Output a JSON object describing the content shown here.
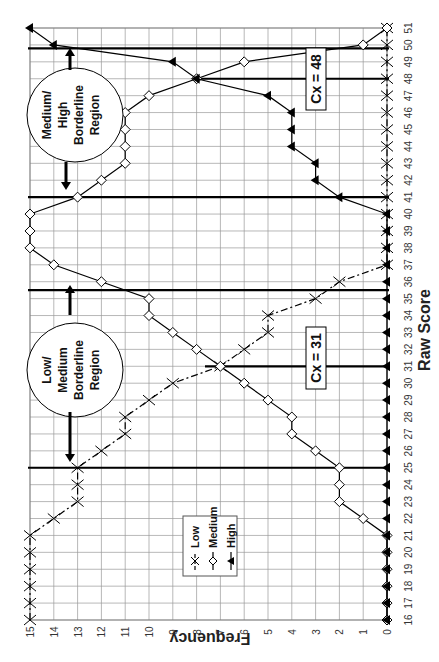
{
  "chart_data": {
    "type": "line",
    "orientation": "rotated-90-clockwise",
    "title": "",
    "xlabel": "Raw Score",
    "ylabel": "Frequency",
    "x": [
      16,
      17,
      18,
      19,
      20,
      21,
      22,
      23,
      24,
      25,
      26,
      27,
      28,
      29,
      30,
      31,
      32,
      33,
      34,
      35,
      36,
      37,
      38,
      39,
      40,
      41,
      42,
      43,
      44,
      45,
      46,
      47,
      48,
      49,
      50,
      51
    ],
    "xlim": [
      16,
      51
    ],
    "ylim": [
      0,
      15
    ],
    "x_ticks": [
      "16",
      "17",
      "18",
      "19",
      "20",
      "21",
      "22",
      "23",
      "24",
      "25",
      "26",
      "27",
      "28",
      "29",
      "30",
      "31",
      "32",
      "33",
      "34",
      "35",
      "36",
      "37",
      "38",
      "39",
      "40",
      "41",
      "42",
      "43",
      "44",
      "45",
      "46",
      "47",
      "48",
      "49",
      "50",
      "51"
    ],
    "y_ticks": [
      "0",
      "1",
      "2",
      "3",
      "4",
      "5",
      "6",
      "7",
      "8",
      "9",
      "10",
      "11",
      "12",
      "13",
      "14",
      "15"
    ],
    "grid": true,
    "series": [
      {
        "name": "Low",
        "marker": "x",
        "line": "dash-dot",
        "values": [
          15,
          15,
          15,
          15,
          15,
          15,
          14,
          13,
          13,
          13,
          12,
          11,
          11,
          10,
          9,
          7,
          6,
          5,
          5,
          3,
          2,
          0,
          0,
          0,
          0,
          0,
          0,
          0,
          0,
          0,
          0,
          0,
          0,
          0,
          0,
          0
        ]
      },
      {
        "name": "Medium",
        "marker": "open-diamond",
        "line": "solid",
        "values": [
          0,
          0,
          0,
          0,
          0,
          0,
          1,
          2,
          2,
          2,
          3,
          4,
          4,
          5,
          6,
          7,
          8,
          9,
          10,
          10,
          12,
          14,
          15,
          15,
          15,
          13,
          12,
          11,
          11,
          11,
          11,
          10,
          8,
          6,
          1,
          0
        ]
      },
      {
        "name": "High",
        "marker": "filled-triangle",
        "line": "solid",
        "values": [
          0,
          0,
          0,
          0,
          0,
          0,
          0,
          0,
          0,
          0,
          0,
          0,
          0,
          0,
          0,
          0,
          0,
          0,
          0,
          0,
          0,
          0,
          0,
          0,
          0,
          2,
          3,
          3,
          4,
          4,
          4,
          5,
          8,
          9,
          14,
          15
        ]
      }
    ],
    "legend": {
      "entries": [
        "Low",
        "Medium",
        "High"
      ],
      "position": "inside-lower-middle"
    },
    "annotations": [
      {
        "type": "vertical-line",
        "x": 25,
        "weight": "thick",
        "label": "Low/Medium region start"
      },
      {
        "type": "vertical-line",
        "x": 35.5,
        "weight": "thick",
        "label": "Low/Medium region end"
      },
      {
        "type": "vertical-line",
        "x": 31,
        "weight": "thick",
        "label": "Cx = 31"
      },
      {
        "type": "vertical-line",
        "x": 41,
        "weight": "thick",
        "label": "Medium/High region start"
      },
      {
        "type": "vertical-line",
        "x": 49.8,
        "weight": "thick",
        "label": "Medium/High region end"
      },
      {
        "type": "vertical-line",
        "x": 48,
        "weight": "thick",
        "label": "Cx = 48"
      },
      {
        "type": "circle-callout",
        "text": "Low/ Medium Borderline Region"
      },
      {
        "type": "circle-callout",
        "text": "Medium/ High Borderline Region"
      },
      {
        "type": "box-label",
        "text": "Cx = 31"
      },
      {
        "type": "box-label",
        "text": "Cx = 48"
      }
    ]
  },
  "labels": {
    "xlabel": "Raw Score",
    "ylabel": "Frequency",
    "cx_low": "Cx = 31",
    "cx_high": "Cx = 48",
    "region_low_lines": [
      "Low/",
      "Medium",
      "Borderline",
      "Region"
    ],
    "region_high_lines": [
      "Medium/",
      "High",
      "Borderline",
      "Region"
    ],
    "legend": [
      "Low",
      "Medium",
      "High"
    ]
  }
}
